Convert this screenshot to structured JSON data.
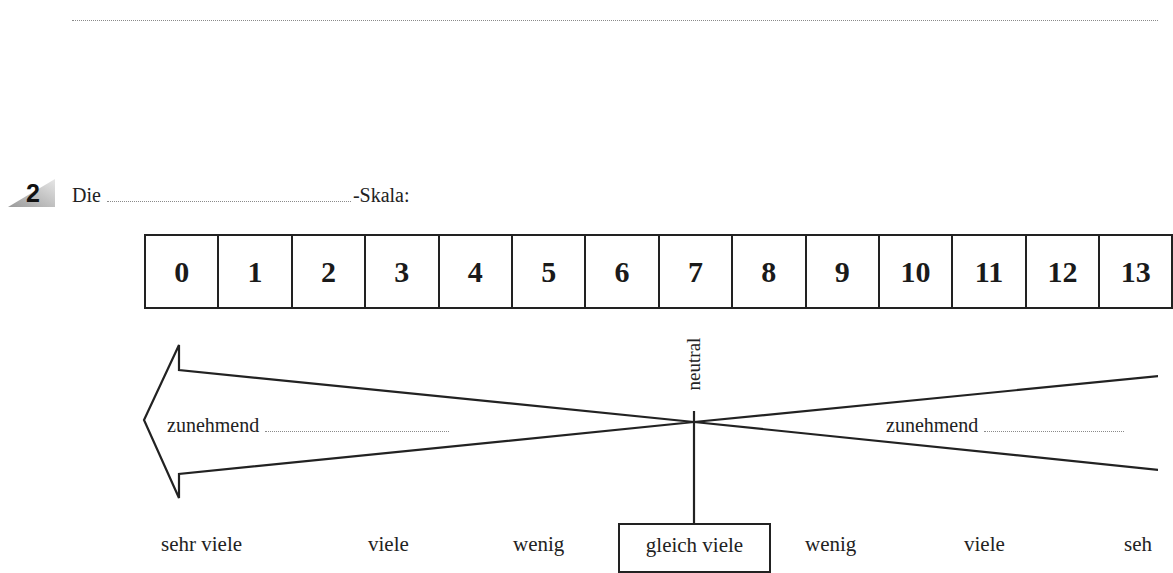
{
  "task": {
    "number": "2",
    "prefix": "Die",
    "suffix": "-Skala:"
  },
  "scale": {
    "cells": [
      "0",
      "1",
      "2",
      "3",
      "4",
      "5",
      "6",
      "7",
      "8",
      "9",
      "10",
      "11",
      "12",
      "13"
    ]
  },
  "diagram": {
    "neutral_label": "neutral",
    "left_arrow_label": "zunehmend",
    "right_arrow_label": "zunehmend"
  },
  "categories": {
    "left": [
      "sehr viele",
      "viele",
      "wenig"
    ],
    "center": "gleich viele",
    "right": [
      "wenig",
      "viele",
      "seh"
    ]
  },
  "colors": {
    "line": "#222222",
    "dotted": "#8a8a8a",
    "badge_gradient_light": "#e6e6e6",
    "badge_gradient_dark": "#9a9a9a"
  }
}
